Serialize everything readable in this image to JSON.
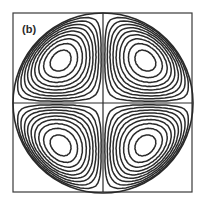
{
  "figure": {
    "panel_label": "(b)",
    "frame": {
      "x": 13,
      "y": 13,
      "size": 179
    },
    "circle": {
      "cx": 103,
      "cy": 103,
      "r": 90
    },
    "stroke_color": "#2a2a2a",
    "cells": [
      {
        "name": "top-left",
        "cx": 63,
        "cy": 66,
        "sx": -1,
        "sy": -1
      },
      {
        "name": "top-right",
        "cx": 143,
        "cy": 66,
        "sx": 1,
        "sy": -1
      },
      {
        "name": "bottom-left",
        "cx": 63,
        "cy": 142,
        "sx": -1,
        "sy": 1
      },
      {
        "name": "bottom-right",
        "cx": 143,
        "cy": 142,
        "sx": 1,
        "sy": 1
      }
    ],
    "contour_levels": 9
  }
}
